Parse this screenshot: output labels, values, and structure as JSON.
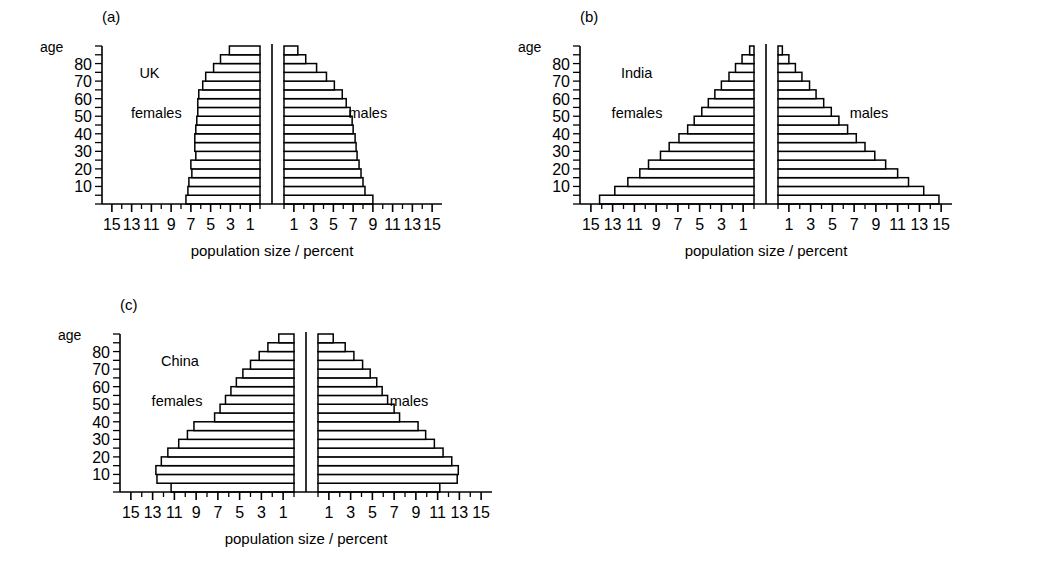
{
  "figure": {
    "background": "#ffffff",
    "ink": "#000000",
    "width": 1041,
    "height": 587
  },
  "axis": {
    "age_axis_label": "age",
    "age_ticks": [
      10,
      20,
      30,
      40,
      50,
      60,
      70,
      80
    ],
    "age_tick_labels": [
      "10",
      "20",
      "30",
      "40",
      "50",
      "60",
      "70",
      "80"
    ],
    "x_axis_label": "population size / percent",
    "x_tick_labels_left": [
      "15",
      "13",
      "11",
      "9",
      "7",
      "5",
      "3",
      "1"
    ],
    "x_tick_labels_right": [
      "1",
      "3",
      "5",
      "7",
      "9",
      "11",
      "13",
      "15"
    ],
    "x_tick_values_left": [
      15,
      13,
      11,
      9,
      7,
      5,
      3,
      1
    ],
    "x_tick_values_right": [
      1,
      3,
      5,
      7,
      9,
      11,
      13,
      15
    ],
    "x_min": 0,
    "x_max": 16,
    "minor_tick_step": 1,
    "female_side_label": "females",
    "male_side_label": "males"
  },
  "panels": [
    {
      "id": "a",
      "tag": "(a)",
      "country": "UK",
      "female_label": "females",
      "male_label": "males"
    },
    {
      "id": "b",
      "tag": "(b)",
      "country": "India",
      "female_label": "females",
      "male_label": "males"
    },
    {
      "id": "c",
      "tag": "(c)",
      "country": "China",
      "female_label": "females",
      "male_label": "males"
    }
  ],
  "chart_data": [
    {
      "type": "bar",
      "subtype": "population-pyramid",
      "panel": "a",
      "title": "UK",
      "xlabel": "population size / percent",
      "ylabel": "age",
      "xlim": [
        0,
        16
      ],
      "ylim": [
        0,
        85
      ],
      "grid": false,
      "legend": [
        "females",
        "males"
      ],
      "legend_position": "inside-left / inside-right",
      "age_bands": [
        "0-4",
        "5-9",
        "10-14",
        "15-19",
        "20-24",
        "25-29",
        "30-34",
        "35-39",
        "40-44",
        "45-49",
        "50-54",
        "55-59",
        "60-64",
        "65-69",
        "70-74",
        "75-79",
        "80-84",
        "85+"
      ],
      "age_band_centres": [
        2,
        7,
        12,
        17,
        22,
        27,
        32,
        37,
        42,
        47,
        52,
        57,
        62,
        67,
        72,
        77,
        82,
        87
      ],
      "series": [
        {
          "name": "females",
          "side": "left",
          "values": [
            7.5,
            7.3,
            7.2,
            6.9,
            7.0,
            6.5,
            6.6,
            6.6,
            6.5,
            6.4,
            6.3,
            6.3,
            6.2,
            5.8,
            5.5,
            4.7,
            4.0,
            3.1
          ]
        },
        {
          "name": "males",
          "side": "right",
          "values": [
            9.0,
            8.2,
            8.0,
            7.8,
            7.6,
            7.4,
            7.3,
            7.2,
            7.0,
            6.9,
            6.7,
            6.3,
            5.9,
            5.1,
            4.3,
            3.3,
            2.2,
            1.4
          ]
        }
      ]
    },
    {
      "type": "bar",
      "subtype": "population-pyramid",
      "panel": "b",
      "title": "India",
      "xlabel": "population size / percent",
      "ylabel": "age",
      "xlim": [
        0,
        16
      ],
      "ylim": [
        0,
        85
      ],
      "grid": false,
      "legend": [
        "females",
        "males"
      ],
      "legend_position": "inside-left / inside-right",
      "age_bands": [
        "0-4",
        "5-9",
        "10-14",
        "15-19",
        "20-24",
        "25-29",
        "30-34",
        "35-39",
        "40-44",
        "45-49",
        "50-54",
        "55-59",
        "60-64",
        "65-69",
        "70-74",
        "75-79",
        "80-84",
        "85+"
      ],
      "age_band_centres": [
        2,
        7,
        12,
        17,
        22,
        27,
        32,
        37,
        42,
        47,
        52,
        57,
        62,
        67,
        72,
        77,
        82,
        87
      ],
      "series": [
        {
          "name": "females",
          "side": "left",
          "values": [
            14.2,
            12.8,
            11.6,
            10.5,
            9.7,
            8.6,
            7.8,
            6.9,
            6.1,
            5.5,
            4.8,
            4.2,
            3.6,
            3.0,
            2.3,
            1.7,
            1.1,
            0.4
          ]
        },
        {
          "name": "males",
          "side": "right",
          "values": [
            14.8,
            13.4,
            12.0,
            11.0,
            9.9,
            8.9,
            8.0,
            7.2,
            6.4,
            5.6,
            4.9,
            4.2,
            3.5,
            2.9,
            2.2,
            1.6,
            1.0,
            0.4
          ]
        }
      ]
    },
    {
      "type": "bar",
      "subtype": "population-pyramid",
      "panel": "c",
      "title": "China",
      "xlabel": "population size / percent",
      "ylabel": "age",
      "xlim": [
        0,
        16
      ],
      "ylim": [
        0,
        85
      ],
      "grid": false,
      "legend": [
        "females",
        "males"
      ],
      "legend_position": "inside-left / inside-right",
      "age_bands": [
        "0-4",
        "5-9",
        "10-14",
        "15-19",
        "20-24",
        "25-29",
        "30-34",
        "35-39",
        "40-44",
        "45-49",
        "50-54",
        "55-59",
        "60-64",
        "65-69",
        "70-74",
        "75-79",
        "80-84",
        "85+"
      ],
      "age_band_centres": [
        2,
        7,
        12,
        17,
        22,
        27,
        32,
        37,
        42,
        47,
        52,
        57,
        62,
        67,
        72,
        77,
        82,
        87
      ],
      "series": [
        {
          "name": "females",
          "side": "left",
          "values": [
            11.3,
            12.6,
            12.7,
            12.2,
            11.6,
            10.6,
            9.8,
            9.2,
            7.3,
            6.8,
            6.3,
            5.8,
            5.3,
            4.7,
            4.0,
            3.2,
            2.4,
            1.4
          ]
        },
        {
          "name": "males",
          "side": "right",
          "values": [
            11.2,
            12.8,
            12.9,
            12.3,
            11.5,
            10.7,
            9.9,
            9.2,
            7.5,
            7.0,
            6.4,
            5.9,
            5.4,
            4.8,
            4.1,
            3.3,
            2.5,
            1.4
          ]
        }
      ]
    }
  ]
}
